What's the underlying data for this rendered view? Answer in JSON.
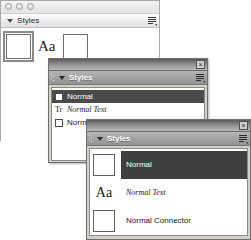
{
  "window1": {
    "name": "styles-panel-mac",
    "traffic_lights": [
      "close-dot",
      "minimize-dot",
      "zoom-dot"
    ],
    "header": {
      "disclosure": "triangle-down-icon",
      "title": "Styles",
      "menu_icon": "list-options-icon"
    },
    "items": [
      {
        "preview": "empty-square",
        "label": "",
        "selected": true
      },
      {
        "preview": "Aa",
        "label": "",
        "selected": false
      },
      {
        "preview": "empty-square",
        "label": "",
        "selected": false
      }
    ]
  },
  "window2": {
    "name": "styles-panel-compact-list",
    "titlebar": {
      "close_label": "×"
    },
    "header": {
      "disclosure": "triangle-down-icon",
      "title": "Styles",
      "menu_icon": "list-options-icon"
    },
    "rows": [
      {
        "icon": "empty-square",
        "label": "Normal",
        "italic": false,
        "selected": true
      },
      {
        "icon": "Tr",
        "label": "Normal Text",
        "italic": true,
        "selected": false
      },
      {
        "icon": "empty-square",
        "label": "Normal Connector",
        "italic": false,
        "selected": false
      }
    ]
  },
  "window3": {
    "name": "styles-panel-large-list",
    "titlebar": {
      "close_label": "×"
    },
    "header": {
      "disclosure": "triangle-down-icon",
      "title": "Styles",
      "menu_icon": "list-options-icon"
    },
    "rows": [
      {
        "thumb": "empty-square",
        "label": "Normal",
        "italic": false,
        "selected": true
      },
      {
        "thumb": "Aa",
        "label": "Normal Text",
        "italic": true,
        "selected": false
      },
      {
        "thumb": "empty-square",
        "label": "Normal Connector",
        "italic": false,
        "selected": false
      }
    ]
  }
}
